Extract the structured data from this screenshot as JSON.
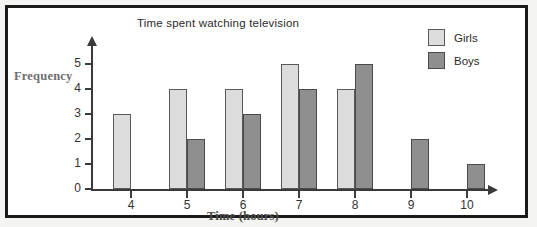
{
  "chart_data": {
    "type": "bar",
    "title": "Time spent watching television",
    "xlabel": "Time (hours)",
    "ylabel": "Frequency",
    "categories": [
      "4",
      "5",
      "6",
      "7",
      "8",
      "9",
      "10"
    ],
    "series": [
      {
        "name": "Girls",
        "color": "#dcdcdc",
        "values": [
          3,
          4,
          4,
          5,
          4,
          0,
          0
        ]
      },
      {
        "name": "Boys",
        "color": "#8f8f8f",
        "values": [
          0,
          2,
          3,
          4,
          5,
          2,
          1
        ]
      }
    ],
    "ylim": [
      0,
      5
    ],
    "yticks": [
      "0",
      "1",
      "2",
      "3",
      "4",
      "5"
    ],
    "grid": false,
    "legend_position": "top-right"
  },
  "legend": {
    "items": [
      {
        "label": "Girls",
        "swatch": "girls"
      },
      {
        "label": "Boys",
        "swatch": "boys"
      }
    ]
  }
}
